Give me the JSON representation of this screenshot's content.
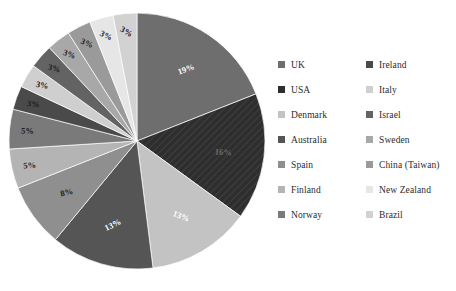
{
  "chart_data": {
    "type": "pie",
    "title": "",
    "subtitle": "",
    "xlabel": "",
    "ylabel": "",
    "legend_position": "right",
    "grid": false,
    "start_angle_deg": 0,
    "direction": "clockwise",
    "categories": [
      "UK",
      "USA",
      "Denmark",
      "Australia",
      "Spain",
      "Finland",
      "Norway",
      "Ireland",
      "Italy",
      "Israel",
      "Sweden",
      "China (Taiwan)",
      "New Zealand",
      "Brazil"
    ],
    "values": [
      19,
      16,
      13,
      13,
      8,
      5,
      5,
      3,
      3,
      3,
      3,
      3,
      3,
      3
    ],
    "value_labels": [
      "19%",
      "16%",
      "13%",
      "13%",
      "8%",
      "5%",
      "5%",
      "3%",
      "3%",
      "3%",
      "3%",
      "3%",
      "3%",
      "3%"
    ],
    "colors": [
      "#6e6e6e",
      "#2e2e2e",
      "#c3c3c3",
      "#555555",
      "#8f8f8f",
      "#b4b4b4",
      "#7a7a7a",
      "#4a4a4a",
      "#cfcfcf",
      "#636363",
      "#a8a8a8",
      "#9a9a9a",
      "#e6e6e6",
      "#d2d2d2"
    ],
    "slices": [
      {
        "label": "UK",
        "value": 19,
        "value_label": "19%",
        "color": "#6e6e6e",
        "label_color": "#ffffff",
        "hatched": false
      },
      {
        "label": "USA",
        "value": 16,
        "value_label": "16%",
        "color": "#2e2e2e",
        "label_color": "#6b6b6b",
        "hatched": true
      },
      {
        "label": "Denmark",
        "value": 13,
        "value_label": "13%",
        "color": "#c3c3c3",
        "label_color": "#ffffff",
        "hatched": false
      },
      {
        "label": "Australia",
        "value": 13,
        "value_label": "13%",
        "color": "#555555",
        "label_color": "#ffffff",
        "hatched": false
      },
      {
        "label": "Spain",
        "value": 8,
        "value_label": "8%",
        "color": "#8f8f8f",
        "label_color": "#1c1c1c",
        "hatched": false
      },
      {
        "label": "Finland",
        "value": 5,
        "value_label": "5%",
        "color": "#b4b4b4",
        "label_color": "#1c1c1c",
        "hatched": false
      },
      {
        "label": "Norway",
        "value": 5,
        "value_label": "5%",
        "color": "#7a7a7a",
        "label_color": "#1c1c1c",
        "hatched": false
      },
      {
        "label": "Ireland",
        "value": 3,
        "value_label": "3%",
        "color": "#4a4a4a",
        "label_color": "#1c1c1c",
        "hatched": false
      },
      {
        "label": "Italy",
        "value": 3,
        "value_label": "3%",
        "color": "#cfcfcf",
        "label_color": "#1c1c1c",
        "hatched": false
      },
      {
        "label": "Israel",
        "value": 3,
        "value_label": "3%",
        "color": "#636363",
        "label_color": "#1c1c1c",
        "hatched": false
      },
      {
        "label": "Sweden",
        "value": 3,
        "value_label": "3%",
        "color": "#a8a8a8",
        "label_color": "#1c1c1c",
        "hatched": false
      },
      {
        "label": "China (Taiwan)",
        "value": 3,
        "value_label": "3%",
        "color": "#9a9a9a",
        "label_color": "#1c1c1c",
        "hatched": false
      },
      {
        "label": "New Zealand",
        "value": 3,
        "value_label": "3%",
        "color": "#e6e6e6",
        "label_color": "#1c1c1c",
        "hatched": false
      },
      {
        "label": "Brazil",
        "value": 3,
        "value_label": "3%",
        "color": "#d2d2d2",
        "label_color": "#1c1c1c",
        "hatched": false
      }
    ]
  },
  "pie": {
    "center_x": 137,
    "center_y": 141,
    "radius": 128
  },
  "legend": {
    "columns": [
      {
        "items": [
          {
            "label": "UK",
            "color": "#6e6e6e"
          },
          {
            "label": "USA",
            "color": "#2e2e2e"
          },
          {
            "label": "Denmark",
            "color": "#c3c3c3"
          },
          {
            "label": "Australia",
            "color": "#555555"
          },
          {
            "label": "Spain",
            "color": "#8f8f8f"
          },
          {
            "label": "Finland",
            "color": "#b4b4b4"
          },
          {
            "label": "Norway",
            "color": "#7a7a7a"
          }
        ]
      },
      {
        "items": [
          {
            "label": "Ireland",
            "color": "#4a4a4a"
          },
          {
            "label": "Italy",
            "color": "#cfcfcf"
          },
          {
            "label": "Israel",
            "color": "#636363"
          },
          {
            "label": "Sweden",
            "color": "#a8a8a8"
          },
          {
            "label": "China (Taiwan)",
            "color": "#9a9a9a"
          },
          {
            "label": "New Zealand",
            "color": "#e6e6e6"
          },
          {
            "label": "Brazil",
            "color": "#d2d2d2"
          }
        ]
      }
    ]
  }
}
